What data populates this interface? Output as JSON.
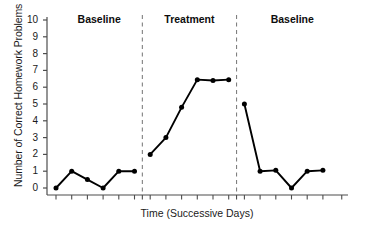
{
  "chart_data": {
    "type": "line",
    "title": "",
    "xlabel": "Time (Successive Days)",
    "ylabel": "Number of Correct Homework Problems",
    "ylim": [
      0,
      10
    ],
    "ytick_labels": [
      "0",
      "1",
      "2",
      "3",
      "4",
      "5",
      "6",
      "7",
      "8",
      "9",
      "10"
    ],
    "ytick_values": [
      0,
      1,
      2,
      3,
      4,
      5,
      6,
      7,
      8,
      9,
      10
    ],
    "xtick_labels": [],
    "grid": false,
    "legend": "none",
    "phases": [
      {
        "name": "Baseline",
        "label": "Baseline",
        "x": [
          1,
          2,
          3,
          4,
          5,
          6
        ],
        "values": [
          0,
          1,
          0.5,
          0,
          1,
          1
        ]
      },
      {
        "name": "Treatment",
        "label": "Treatment",
        "x": [
          7,
          8,
          9,
          10,
          11,
          12
        ],
        "values": [
          2,
          3,
          4.8,
          6.45,
          6.4,
          6.45
        ]
      },
      {
        "name": "Baseline2",
        "label": "Baseline",
        "x": [
          13,
          14,
          15,
          16,
          17,
          18
        ],
        "values": [
          5,
          1,
          1.05,
          0,
          1,
          1.05
        ]
      }
    ],
    "phase_dividers": [
      6.5,
      12.5
    ],
    "series_color": "#000000",
    "divider_color": "#808080",
    "axis_color": "#4d4d4d"
  }
}
